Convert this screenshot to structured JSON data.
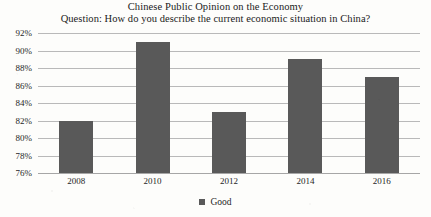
{
  "chart_data": {
    "type": "bar",
    "title": "Chinese Public Opinion on the Economy",
    "subtitle": "Question: How do you describe the current economic situation in China?",
    "categories": [
      "2008",
      "2010",
      "2012",
      "2014",
      "2016"
    ],
    "series": [
      {
        "name": "Good",
        "values": [
          82,
          91,
          83,
          89,
          87
        ]
      }
    ],
    "values": [
      82,
      91,
      83,
      89,
      87
    ],
    "xlabel": "",
    "ylabel": "",
    "ylim": [
      76,
      92
    ],
    "ytick_step": 2,
    "ytick_labels": [
      "92%",
      "90%",
      "88%",
      "86%",
      "84%",
      "82%",
      "80%",
      "78%",
      "76%"
    ],
    "ytick_values": [
      92,
      90,
      88,
      86,
      84,
      82,
      80,
      78,
      76
    ],
    "grid": true,
    "legend_position": "bottom",
    "legend_entries": [
      "Good"
    ],
    "bar_color": "#595959",
    "gridline_color": "#b9b9b9"
  }
}
